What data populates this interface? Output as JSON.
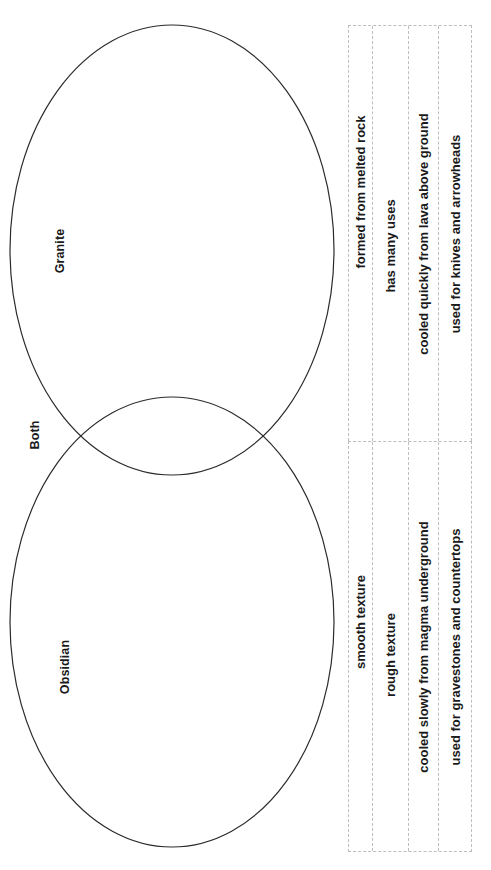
{
  "diagram": {
    "type": "venn-two-set",
    "orientation": "rotated-90-ccw",
    "labels": {
      "left_set": "Granite",
      "intersection": "Both",
      "right_set": "Obsidian"
    },
    "stroke_color": "#2b2b2b",
    "fill_color": "#ffffff"
  },
  "word_bank": {
    "border_color": "#bdbdbd",
    "groups": [
      {
        "name": "word-bank-group-1",
        "items": [
          "formed from melted rock",
          "has many uses",
          "cooled quickly from lava above ground",
          "used for knives and arrowheads"
        ]
      },
      {
        "name": "word-bank-group-2",
        "items": [
          "smooth texture",
          "rough texture",
          "cooled slowly from magma underground",
          "used for gravestones and countertops"
        ]
      }
    ]
  }
}
